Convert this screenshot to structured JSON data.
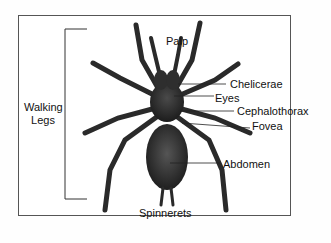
{
  "diagram": {
    "labels": {
      "palp": "Palp",
      "chelicerae": "Chelicerae",
      "eyes": "Eyes",
      "cephalothorax": "Cephalothorax",
      "fovea": "Fovea",
      "abdomen": "Abdomen",
      "spinnerets": "Spinnerets",
      "walking_legs_line1": "Walking",
      "walking_legs_line2": "Legs"
    },
    "colors": {
      "frame": "#555555",
      "spider": "#2a2a2a",
      "text": "#111111",
      "leader": "#222222"
    }
  }
}
